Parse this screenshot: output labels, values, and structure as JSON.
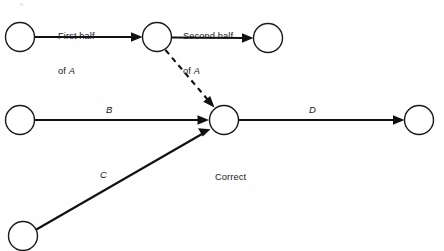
{
  "figure": {
    "background_color": "#fefefe",
    "line_color": "#111111",
    "node_fill": "#ffffff",
    "node_stroke": "#1a1a1a",
    "width": 444,
    "height": 251
  },
  "caption": {
    "text": "Correct",
    "x": 215,
    "y": 172
  },
  "labels": {
    "first_half_line1": "First half",
    "first_half_line2_prefix": "of ",
    "first_half_line2_em": "A",
    "second_half_line1": "Second half",
    "second_half_line2_prefix": "of ",
    "second_half_line2_em": "A",
    "edge_b": "B",
    "edge_c": "C",
    "edge_d": "D"
  },
  "nodes": [
    {
      "id": "n1",
      "name": "node-start-a",
      "cx": 20,
      "cy": 37,
      "r": 14.5
    },
    {
      "id": "n2",
      "name": "node-a-midpoint",
      "cx": 157,
      "cy": 37,
      "r": 14.5
    },
    {
      "id": "n3",
      "name": "node-a-finish",
      "cx": 268,
      "cy": 38,
      "r": 14.5
    },
    {
      "id": "n4",
      "name": "node-start-b",
      "cx": 20,
      "cy": 120,
      "r": 14.5
    },
    {
      "id": "n5",
      "name": "node-merge",
      "cx": 224,
      "cy": 120,
      "r": 14.5
    },
    {
      "id": "n6",
      "name": "node-finish-d",
      "cx": 419,
      "cy": 120,
      "r": 14.5
    },
    {
      "id": "n7",
      "name": "node-start-c",
      "cx": 23,
      "cy": 236,
      "r": 14.5
    }
  ],
  "edges": [
    {
      "id": "e1",
      "name": "edge-first-half-of-a",
      "from": "n1",
      "to": "n2",
      "style": "solid",
      "label": "First half of A",
      "label_x": 58,
      "label_y": 10
    },
    {
      "id": "e2",
      "name": "edge-second-half-of-a",
      "from": "n2",
      "to": "n3",
      "style": "solid",
      "label": "Second half of A",
      "label_x": 183,
      "label_y": 10
    },
    {
      "id": "e3",
      "name": "edge-dummy",
      "from": "n2",
      "to": "n5",
      "style": "dashed",
      "label": "",
      "label_x": 0,
      "label_y": 0
    },
    {
      "id": "e4",
      "name": "edge-b",
      "from": "n4",
      "to": "n5",
      "style": "solid",
      "label": "B",
      "label_x": 110,
      "label_y": 110
    },
    {
      "id": "e5",
      "name": "edge-c",
      "from": "n7",
      "to": "n5",
      "style": "solid",
      "label": "C",
      "label_x": 104,
      "label_y": 175
    },
    {
      "id": "e6",
      "name": "edge-d",
      "from": "n5",
      "to": "n6",
      "style": "solid",
      "label": "D",
      "label_x": 313,
      "label_y": 110
    }
  ]
}
